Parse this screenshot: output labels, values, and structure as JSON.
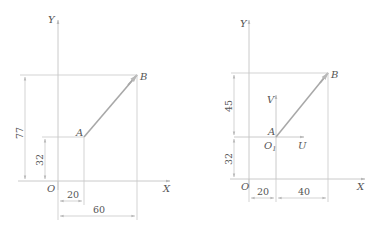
{
  "left_diagram": {
    "labels": {
      "y_axis": "Y",
      "x_axis": "X",
      "origin": "O",
      "point_a": "A",
      "point_b": "B"
    },
    "dimensions": {
      "ay": "32",
      "by": "77",
      "ax": "20",
      "bx": "60"
    }
  },
  "right_diagram": {
    "labels": {
      "y_axis": "Y",
      "x_axis": "X",
      "origin": "O",
      "point_a": "A",
      "point_b": "B",
      "local_origin": "O",
      "local_origin_sub": "1",
      "u_axis": "U",
      "v_axis": "V"
    },
    "dimensions": {
      "ay": "32",
      "dy": "45",
      "ax": "20",
      "dx": "40"
    }
  },
  "colors": {
    "line": "#c8c8c8",
    "segment": "#a8a8a8",
    "text": "#555555"
  }
}
